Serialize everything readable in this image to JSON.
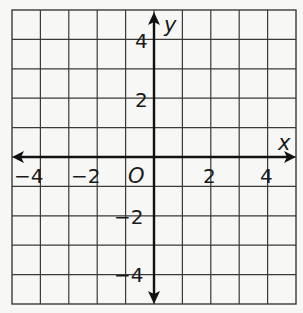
{
  "chart_data": {
    "type": "coordinate-grid",
    "title": "",
    "xlabel": "x",
    "ylabel": "y",
    "origin_label": "O",
    "xlim": [
      -5,
      5
    ],
    "ylim": [
      -5,
      5
    ],
    "grid": true,
    "grid_step": 1,
    "x_tick_labels": [
      {
        "value": -4,
        "text": "−4"
      },
      {
        "value": -2,
        "text": "−2"
      },
      {
        "value": 2,
        "text": "2"
      },
      {
        "value": 4,
        "text": "4"
      }
    ],
    "y_tick_labels": [
      {
        "value": 4,
        "text": "4"
      },
      {
        "value": 2,
        "text": "2"
      },
      {
        "value": -2,
        "text": "−2"
      },
      {
        "value": -4,
        "text": "−4"
      }
    ],
    "series": []
  },
  "colors": {
    "grid": "#3a3a3a",
    "axis": "#111111",
    "background": "#f7f7f5"
  }
}
